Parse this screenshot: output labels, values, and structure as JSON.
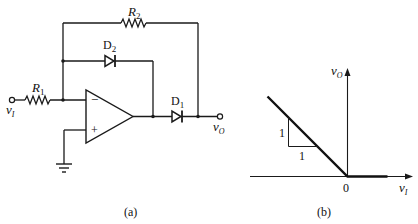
{
  "figure": {
    "circuit": {
      "caption": "(a)",
      "components": {
        "r1": {
          "letter": "R",
          "sub": "1"
        },
        "r2": {
          "letter": "R",
          "sub": "2"
        },
        "d1": {
          "letter": "D",
          "sub": "1"
        },
        "d2": {
          "letter": "D",
          "sub": "2"
        }
      },
      "input_label": {
        "letter": "v",
        "sub": "I"
      },
      "output_label": {
        "letter": "v",
        "sub": "O"
      },
      "opamp": {
        "minus": "−",
        "plus": "+"
      }
    },
    "transfer": {
      "caption": "(b)",
      "y_axis": {
        "letter": "v",
        "sub": "O"
      },
      "x_axis": {
        "letter": "v",
        "sub": "I"
      },
      "origin_label": "0",
      "slope_rise": "1",
      "slope_run": "1"
    }
  },
  "chart_data": {
    "type": "line",
    "title": "",
    "xlabel": "vI",
    "ylabel": "vO",
    "series": [
      {
        "name": "transfer characteristic",
        "x": [
          -1,
          0,
          0.5
        ],
        "y": [
          1,
          0,
          0
        ]
      }
    ],
    "annotations": [
      "slope triangle: rise 1, run 1",
      "origin 0"
    ],
    "grid": false
  }
}
